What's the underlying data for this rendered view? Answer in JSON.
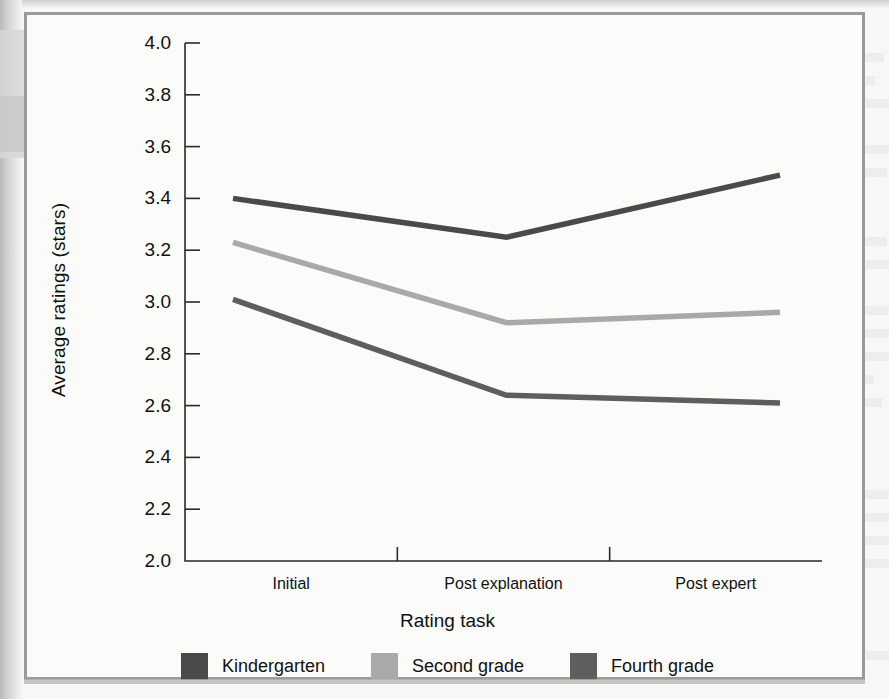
{
  "figure": {
    "y_axis_title": "Average ratings (stars)",
    "x_axis_title": "Rating task"
  },
  "legend": {
    "items": [
      {
        "label": "Kindergarten",
        "color": "#4a4a4a"
      },
      {
        "label": "Second grade",
        "color": "#a9a9a9"
      },
      {
        "label": "Fourth grade",
        "color": "#5e5e5e"
      }
    ]
  },
  "chart_data": {
    "type": "line",
    "title": "",
    "xlabel": "Rating task",
    "ylabel": "Average ratings (stars)",
    "categories": [
      "Initial",
      "Post explanation",
      "Post expert"
    ],
    "ylim": [
      2.0,
      4.0
    ],
    "ytick_labels": [
      "2.0",
      "2.2",
      "2.4",
      "2.6",
      "2.8",
      "3.0",
      "3.2",
      "3.4",
      "3.6",
      "3.8",
      "4.0"
    ],
    "ytick_values": [
      2.0,
      2.2,
      2.4,
      2.6,
      2.8,
      3.0,
      3.2,
      3.4,
      3.6,
      3.8,
      4.0
    ],
    "grid": false,
    "legend_position": "bottom",
    "series": [
      {
        "name": "Kindergarten",
        "color": "#4a4a4a",
        "values": [
          3.4,
          3.25,
          3.49
        ]
      },
      {
        "name": "Second grade",
        "color": "#a9a9a9",
        "values": [
          3.23,
          2.92,
          2.96
        ]
      },
      {
        "name": "Fourth grade",
        "color": "#5e5e5e",
        "values": [
          3.01,
          2.64,
          2.61
        ]
      }
    ]
  }
}
